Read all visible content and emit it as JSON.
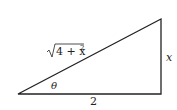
{
  "diagram": {
    "type": "right-triangle",
    "labels": {
      "hypotenuse_radicand": "4 + x",
      "hypotenuse_exponent": "2",
      "hypotenuse_full": "√(4 + x²)",
      "angle": "θ",
      "adjacent": "2",
      "opposite": "x"
    },
    "colors": {
      "line": "#222222",
      "background": "#ffffff"
    }
  }
}
